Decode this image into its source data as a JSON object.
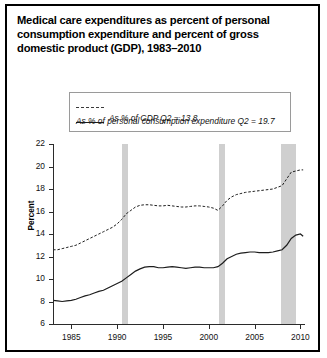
{
  "title": "Medical care expenditures as percent of personal consumption expenditure and percent of gross domestic product (GDP), 1983–2010",
  "legend": {
    "entries": [
      {
        "label": "As % of personal consumption expenditure Q2 = 19.7",
        "style": "dashed"
      },
      {
        "label": "As % of GDP Q2 = 13.8",
        "style": "solid"
      }
    ]
  },
  "axes": {
    "ylabel": "Percent",
    "yticks": [
      "6",
      "8",
      "10",
      "12",
      "14",
      "16",
      "18",
      "20",
      "22"
    ],
    "xticks": [
      "1985",
      "1990",
      "1995",
      "2000",
      "2005",
      "2010"
    ]
  },
  "colors": {
    "line": "#1d1d1d",
    "band": "#cfcfcf",
    "axis": "#2b2b2b",
    "border": "#000000",
    "background": "#ffffff"
  },
  "chart_data": {
    "type": "line",
    "title": "Medical care expenditures as percent of personal consumption expenditure and percent of gross domestic product (GDP), 1983–2010",
    "xlabel": "",
    "ylabel": "Percent",
    "xlim": [
      1983,
      2010.5
    ],
    "ylim": [
      6,
      22
    ],
    "ytick_step": 2,
    "grid": false,
    "legend_position": "top-center",
    "recession_bands": [
      {
        "start": 1990.5,
        "end": 1991.2
      },
      {
        "start": 2001.1,
        "end": 2001.8
      },
      {
        "start": 2007.9,
        "end": 2009.5
      }
    ],
    "x": [
      1983.0,
      1983.5,
      1984.0,
      1984.5,
      1985.0,
      1985.5,
      1986.0,
      1986.5,
      1987.0,
      1987.5,
      1988.0,
      1988.5,
      1989.0,
      1989.5,
      1990.0,
      1990.5,
      1991.0,
      1991.5,
      1992.0,
      1992.5,
      1993.0,
      1993.5,
      1994.0,
      1994.5,
      1995.0,
      1995.5,
      1996.0,
      1996.5,
      1997.0,
      1997.5,
      1998.0,
      1998.5,
      1999.0,
      1999.5,
      2000.0,
      2000.5,
      2001.0,
      2001.5,
      2002.0,
      2002.5,
      2003.0,
      2003.5,
      2004.0,
      2004.5,
      2005.0,
      2005.5,
      2006.0,
      2006.5,
      2007.0,
      2007.5,
      2008.0,
      2008.5,
      2009.0,
      2009.5,
      2010.0,
      2010.3
    ],
    "series": [
      {
        "name": "As % of personal consumption expenditure",
        "style": "dashed",
        "last_value_label": "Q2 = 19.7",
        "values": [
          12.6,
          12.6,
          12.7,
          12.8,
          12.9,
          13.0,
          13.2,
          13.4,
          13.6,
          13.8,
          14.0,
          14.2,
          14.4,
          14.6,
          14.9,
          15.3,
          15.8,
          16.1,
          16.4,
          16.55,
          16.6,
          16.6,
          16.55,
          16.5,
          16.5,
          16.55,
          16.5,
          16.45,
          16.4,
          16.4,
          16.45,
          16.5,
          16.5,
          16.45,
          16.4,
          16.3,
          16.1,
          16.5,
          17.0,
          17.3,
          17.5,
          17.6,
          17.7,
          17.75,
          17.8,
          17.85,
          17.9,
          17.95,
          18.0,
          18.15,
          18.3,
          18.9,
          19.5,
          19.6,
          19.7,
          19.7
        ]
      },
      {
        "name": "As % of GDP",
        "style": "solid",
        "last_value_label": "Q2 = 13.8",
        "values": [
          8.1,
          8.05,
          8.0,
          8.05,
          8.1,
          8.2,
          8.35,
          8.5,
          8.6,
          8.75,
          8.9,
          9.0,
          9.2,
          9.4,
          9.6,
          9.8,
          10.1,
          10.4,
          10.7,
          10.9,
          11.05,
          11.1,
          11.1,
          11.0,
          11.0,
          11.05,
          11.1,
          11.05,
          11.0,
          10.95,
          11.0,
          11.05,
          11.05,
          11.0,
          11.0,
          11.0,
          11.1,
          11.4,
          11.8,
          12.0,
          12.2,
          12.3,
          12.35,
          12.4,
          12.4,
          12.35,
          12.35,
          12.35,
          12.4,
          12.5,
          12.6,
          13.0,
          13.6,
          13.9,
          14.0,
          13.8
        ]
      }
    ]
  }
}
